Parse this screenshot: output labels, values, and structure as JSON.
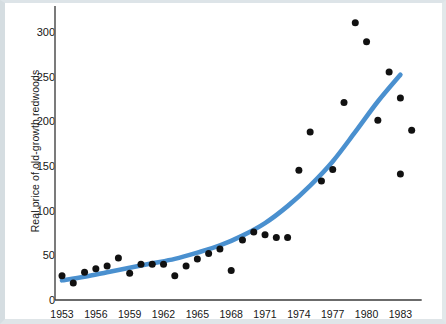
{
  "chart_data": {
    "type": "scatter",
    "title": "",
    "xlabel": "",
    "ylabel": "Real price of old-growth redwoods",
    "xlim": [
      1953,
      1984
    ],
    "ylim": [
      0,
      320
    ],
    "grid": false,
    "legend": null,
    "xticks": [
      "1953",
      "1956",
      "1959",
      "1962",
      "1965",
      "1968",
      "1971",
      "1974",
      "1977",
      "1980",
      "1983"
    ],
    "xtick_values": [
      1953,
      1956,
      1959,
      1962,
      1965,
      1968,
      1971,
      1974,
      1977,
      1980,
      1983
    ],
    "yticks": [
      "0",
      "50",
      "100",
      "150",
      "200",
      "250",
      "300"
    ],
    "ytick_values": [
      0,
      50,
      100,
      150,
      200,
      250,
      300
    ],
    "marker_color": "#111111",
    "curve_color": "#4a90cf",
    "series": [
      {
        "name": "Real price of old-growth redwoods",
        "type": "scatter",
        "points": [
          {
            "x": 1953,
            "y": 27
          },
          {
            "x": 1954,
            "y": 19
          },
          {
            "x": 1955,
            "y": 31
          },
          {
            "x": 1956,
            "y": 35
          },
          {
            "x": 1957,
            "y": 38
          },
          {
            "x": 1958,
            "y": 47
          },
          {
            "x": 1959,
            "y": 30
          },
          {
            "x": 1960,
            "y": 40
          },
          {
            "x": 1961,
            "y": 40
          },
          {
            "x": 1962,
            "y": 40
          },
          {
            "x": 1963,
            "y": 27
          },
          {
            "x": 1964,
            "y": 38
          },
          {
            "x": 1965,
            "y": 46
          },
          {
            "x": 1966,
            "y": 52
          },
          {
            "x": 1967,
            "y": 57
          },
          {
            "x": 1968,
            "y": 33
          },
          {
            "x": 1969,
            "y": 67
          },
          {
            "x": 1970,
            "y": 76
          },
          {
            "x": 1971,
            "y": 73
          },
          {
            "x": 1972,
            "y": 70
          },
          {
            "x": 1973,
            "y": 70
          },
          {
            "x": 1974,
            "y": 145
          },
          {
            "x": 1975,
            "y": 188
          },
          {
            "x": 1976,
            "y": 133
          },
          {
            "x": 1977,
            "y": 146
          },
          {
            "x": 1978,
            "y": 221
          },
          {
            "x": 1979,
            "y": 310
          },
          {
            "x": 1980,
            "y": 289
          },
          {
            "x": 1981,
            "y": 201
          },
          {
            "x": 1982,
            "y": 255
          },
          {
            "x": 1983,
            "y": 226
          },
          {
            "x": 1983,
            "y": 141
          },
          {
            "x": 1984,
            "y": 190
          }
        ]
      },
      {
        "name": "fitted exponential trend",
        "type": "line",
        "points": [
          {
            "x": 1953,
            "y": 22
          },
          {
            "x": 1955,
            "y": 26
          },
          {
            "x": 1957,
            "y": 31
          },
          {
            "x": 1959,
            "y": 36
          },
          {
            "x": 1961,
            "y": 41
          },
          {
            "x": 1963,
            "y": 46
          },
          {
            "x": 1965,
            "y": 53
          },
          {
            "x": 1967,
            "y": 61
          },
          {
            "x": 1969,
            "y": 72
          },
          {
            "x": 1971,
            "y": 86
          },
          {
            "x": 1973,
            "y": 105
          },
          {
            "x": 1975,
            "y": 128
          },
          {
            "x": 1977,
            "y": 155
          },
          {
            "x": 1979,
            "y": 188
          },
          {
            "x": 1981,
            "y": 222
          },
          {
            "x": 1983,
            "y": 252
          }
        ]
      }
    ]
  }
}
